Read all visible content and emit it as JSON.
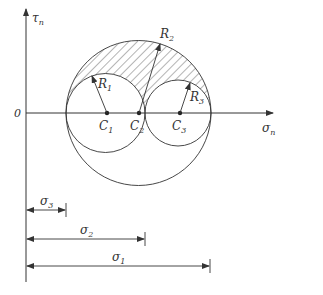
{
  "diagram": {
    "axes": {
      "y_label": "τ",
      "y_label_sub": "n",
      "x_label": "σ",
      "x_label_sub": "n",
      "origin_label": "0"
    },
    "circles": [
      {
        "id": "circle-1",
        "center_label": "C",
        "center_sub": "1",
        "radius_label": "R",
        "radius_sub": "1"
      },
      {
        "id": "circle-2",
        "center_label": "C",
        "center_sub": "2",
        "radius_label": "R",
        "radius_sub": "2"
      },
      {
        "id": "circle-3",
        "center_label": "C",
        "center_sub": "3",
        "radius_label": "R",
        "radius_sub": "3"
      }
    ],
    "dimensions": [
      {
        "id": "sigma-3",
        "label": "σ",
        "sub": "3"
      },
      {
        "id": "sigma-2",
        "label": "σ",
        "sub": "2"
      },
      {
        "id": "sigma-1",
        "label": "σ",
        "sub": "1"
      }
    ],
    "shaded_region": "admissible stress region between outer circle and inner circles",
    "colors": {
      "line": "#333333",
      "hatch": "#444444",
      "background": "#ffffff"
    }
  }
}
